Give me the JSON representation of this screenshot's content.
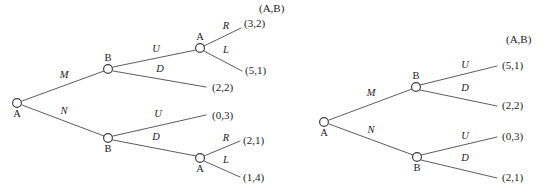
{
  "figure": {
    "type": "game-tree-diagram",
    "line_color": "#4a4a4a",
    "node_fill": "#ffffff",
    "node_stroke": "#3c3c3c",
    "text_color": "#1b1b1b"
  },
  "trees": [
    {
      "id": "left-tree",
      "payoff_header": "(A,B)",
      "nodes": [
        {
          "id": "L0",
          "label": "A",
          "x": 17,
          "y": 103,
          "r": 4.4,
          "label_dx": 0,
          "label_dy": 14
        },
        {
          "id": "L1",
          "label": "B",
          "x": 108,
          "y": 69,
          "r": 4.4,
          "label_dx": 0,
          "label_dy": -8
        },
        {
          "id": "L2",
          "label": "B",
          "x": 108,
          "y": 138,
          "r": 4.4,
          "label_dx": 0,
          "label_dy": 14
        },
        {
          "id": "L3",
          "label": "A",
          "x": 200,
          "y": 48,
          "r": 4.4,
          "label_dx": 0,
          "label_dy": -8
        },
        {
          "id": "L4",
          "label": "A",
          "x": 200,
          "y": 158,
          "r": 4.4,
          "label_dx": 0,
          "label_dy": 14
        }
      ],
      "edges": [
        {
          "from": "L0",
          "to": "L1",
          "x1": 22,
          "y1": 101,
          "x2": 104,
          "y2": 71,
          "label": "M",
          "lx": 64,
          "ly": 78
        },
        {
          "from": "L0",
          "to": "L2",
          "x1": 22,
          "y1": 105,
          "x2": 104,
          "y2": 136,
          "label": "N",
          "lx": 64,
          "ly": 114
        },
        {
          "from": "L1",
          "to": "L3",
          "x1": 113,
          "y1": 67,
          "x2": 196,
          "y2": 50,
          "label": "U",
          "lx": 156,
          "ly": 52
        },
        {
          "from": "L1",
          "to": "terminal_L22",
          "x1": 113,
          "y1": 71,
          "x2": 206,
          "y2": 87,
          "label": "D",
          "lx": 160,
          "ly": 72
        },
        {
          "from": "L2",
          "to": "terminal_L03",
          "x1": 113,
          "y1": 136,
          "x2": 206,
          "y2": 115,
          "label": "U",
          "lx": 158,
          "ly": 117
        },
        {
          "from": "L2",
          "to": "L4",
          "x1": 113,
          "y1": 140,
          "x2": 196,
          "y2": 156,
          "label": "D",
          "lx": 156,
          "ly": 140
        },
        {
          "from": "L3",
          "to": "terminal_32",
          "x1": 204,
          "y1": 46,
          "x2": 241,
          "y2": 28,
          "label": "R",
          "lx": 226,
          "ly": 29
        },
        {
          "from": "L3",
          "to": "terminal_51",
          "x1": 204,
          "y1": 51,
          "x2": 242,
          "y2": 71,
          "label": "L",
          "lx": 226,
          "ly": 53
        },
        {
          "from": "L4",
          "to": "terminal_21",
          "x1": 204,
          "y1": 156,
          "x2": 240,
          "y2": 141,
          "label": "R",
          "lx": 226,
          "ly": 141
        },
        {
          "from": "L4",
          "to": "terminal_14",
          "x1": 204,
          "y1": 161,
          "x2": 240,
          "y2": 177,
          "label": "L",
          "lx": 226,
          "ly": 163
        }
      ],
      "header": {
        "text": "(A,B)",
        "x": 259,
        "y": 12
      },
      "payoffs": [
        {
          "id": "terminal_32",
          "text": "(3,2)",
          "x": 244,
          "y": 27
        },
        {
          "id": "terminal_51",
          "text": "(5,1)",
          "x": 245,
          "y": 74
        },
        {
          "id": "terminal_L22",
          "text": "(2,2)",
          "x": 212,
          "y": 91
        },
        {
          "id": "terminal_L03",
          "text": "(0,3)",
          "x": 212,
          "y": 119
        },
        {
          "id": "terminal_21",
          "text": "(2,1)",
          "x": 243,
          "y": 144
        },
        {
          "id": "terminal_14",
          "text": "(1,4)",
          "x": 243,
          "y": 181
        }
      ]
    },
    {
      "id": "right-tree",
      "payoff_header": "(A,B)",
      "nodes": [
        {
          "id": "R0",
          "label": "A",
          "x": 324,
          "y": 122,
          "r": 4.4,
          "label_dx": 0,
          "label_dy": 14
        },
        {
          "id": "R1",
          "label": "B",
          "x": 416,
          "y": 87,
          "r": 4.4,
          "label_dx": 0,
          "label_dy": -8
        },
        {
          "id": "R2",
          "label": "B",
          "x": 417,
          "y": 157,
          "r": 4.4,
          "label_dx": 0,
          "label_dy": 14
        }
      ],
      "edges": [
        {
          "from": "R0",
          "to": "R1",
          "x1": 329,
          "y1": 120,
          "x2": 412,
          "y2": 89,
          "label": "M",
          "lx": 371,
          "ly": 96
        },
        {
          "from": "R0",
          "to": "R2",
          "x1": 329,
          "y1": 124,
          "x2": 413,
          "y2": 155,
          "label": "N",
          "lx": 371,
          "ly": 133
        },
        {
          "from": "R1",
          "to": "terminal_R51",
          "x1": 420,
          "y1": 85,
          "x2": 497,
          "y2": 66,
          "label": "U",
          "lx": 465,
          "ly": 68
        },
        {
          "from": "R1",
          "to": "terminal_R22",
          "x1": 420,
          "y1": 90,
          "x2": 497,
          "y2": 106,
          "label": "D",
          "lx": 465,
          "ly": 91
        },
        {
          "from": "R2",
          "to": "terminal_R03",
          "x1": 421,
          "y1": 155,
          "x2": 497,
          "y2": 137,
          "label": "U",
          "lx": 465,
          "ly": 139
        },
        {
          "from": "R2",
          "to": "terminal_R21",
          "x1": 421,
          "y1": 160,
          "x2": 497,
          "y2": 178,
          "label": "D",
          "lx": 465,
          "ly": 161
        }
      ],
      "header": {
        "text": "(A,B)",
        "x": 506,
        "y": 43
      },
      "payoffs": [
        {
          "id": "terminal_R51",
          "text": "(5,1)",
          "x": 502,
          "y": 69
        },
        {
          "id": "terminal_R22",
          "text": "(2,2)",
          "x": 502,
          "y": 109
        },
        {
          "id": "terminal_R03",
          "text": "(0,3)",
          "x": 502,
          "y": 140
        },
        {
          "id": "terminal_R21",
          "text": "(2,1)",
          "x": 502,
          "y": 181
        }
      ]
    }
  ]
}
